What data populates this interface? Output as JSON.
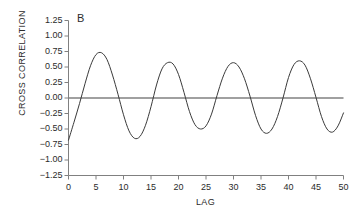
{
  "chart_data": {
    "type": "line",
    "title": "",
    "panel_label": "B",
    "xlabel": "LAG",
    "ylabel": "CROSS CORRELATION",
    "xlim": [
      0,
      50
    ],
    "ylim": [
      -1.25,
      1.25
    ],
    "xticks": [
      0,
      5,
      10,
      15,
      20,
      25,
      30,
      35,
      40,
      45,
      50
    ],
    "xtick_labels": [
      "0",
      "5",
      "10",
      "15",
      "20",
      "25",
      "30",
      "35",
      "40",
      "45",
      "50"
    ],
    "yticks": [
      -1.25,
      -1.0,
      -0.75,
      -0.5,
      -0.25,
      0.0,
      0.25,
      0.5,
      0.75,
      1.0,
      1.25
    ],
    "ytick_labels": [
      "−1.25",
      "−1.00",
      "−0.75",
      "−0.50",
      "−0.25",
      "0.00",
      "0.25",
      "0.50",
      "0.75",
      "1.00",
      "1.25"
    ],
    "grid": false,
    "legend": "none",
    "zero_line": true,
    "zero_line_color": "#808080",
    "line_color": "#3a3a3a",
    "axis_color": "#808080",
    "series": [
      {
        "name": "cross correlation",
        "x": [
          0,
          1,
          2,
          3,
          4,
          5,
          6,
          7,
          8,
          9,
          10,
          11,
          12,
          13,
          14,
          15,
          16,
          17,
          18,
          19,
          20,
          21,
          22,
          23,
          24,
          25,
          26,
          27,
          28,
          29,
          30,
          31,
          32,
          33,
          34,
          35,
          36,
          37,
          38,
          39,
          40,
          41,
          42,
          43,
          44,
          45,
          46,
          47,
          48,
          49,
          50
        ],
        "values": [
          -0.68,
          -0.39,
          -0.09,
          0.23,
          0.52,
          0.7,
          0.73,
          0.62,
          0.37,
          0.06,
          -0.27,
          -0.53,
          -0.65,
          -0.62,
          -0.44,
          -0.14,
          0.21,
          0.47,
          0.57,
          0.55,
          0.38,
          0.09,
          -0.22,
          -0.43,
          -0.5,
          -0.45,
          -0.26,
          0.04,
          0.32,
          0.51,
          0.57,
          0.5,
          0.31,
          0.03,
          -0.28,
          -0.5,
          -0.57,
          -0.5,
          -0.3,
          0.0,
          0.33,
          0.54,
          0.6,
          0.53,
          0.31,
          0.01,
          -0.3,
          -0.5,
          -0.55,
          -0.45,
          -0.24
        ]
      }
    ]
  }
}
